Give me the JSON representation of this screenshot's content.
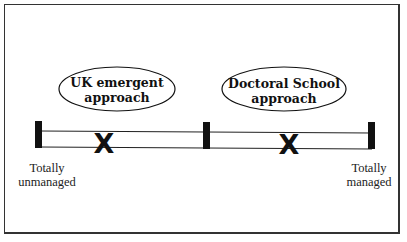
{
  "diagram": {
    "type": "continuum",
    "approaches": [
      {
        "label_line1": "UK emergent",
        "label_line2": "approach",
        "marker": "X"
      },
      {
        "label_line1": "Doctoral School",
        "label_line2": "approach",
        "marker": "X"
      }
    ],
    "endpoints": {
      "left": {
        "line1": "Totally",
        "line2": "unmanaged"
      },
      "right": {
        "line1": "Totally",
        "line2": "managed"
      }
    },
    "colors": {
      "stroke": "#111111",
      "background": "#ffffff",
      "frame": "#333333"
    }
  }
}
